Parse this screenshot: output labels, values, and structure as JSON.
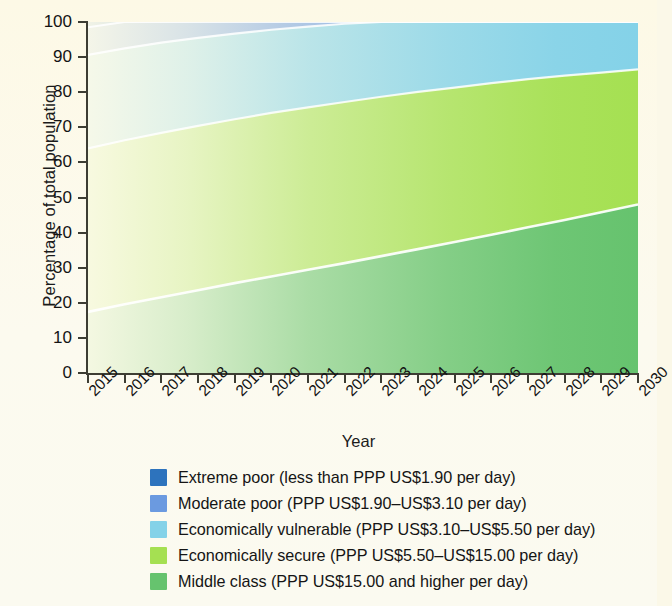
{
  "chart_data": {
    "type": "area",
    "title": "",
    "xlabel": "Year",
    "ylabel": "Percentage of total population",
    "stacked": true,
    "normalized": true,
    "grid": false,
    "legend_position": "bottom",
    "xlim": [
      2015,
      2030
    ],
    "ylim": [
      0,
      100
    ],
    "yticks": [
      0,
      10,
      20,
      30,
      40,
      50,
      60,
      70,
      80,
      90,
      100
    ],
    "ytick_labels": [
      "0",
      "10",
      "20",
      "30",
      "40",
      "50",
      "60",
      "70",
      "80",
      "90",
      "100"
    ],
    "xticks": [
      2015,
      2016,
      2017,
      2018,
      2019,
      2020,
      2021,
      2022,
      2023,
      2024,
      2025,
      2026,
      2027,
      2028,
      2029,
      2030
    ],
    "categories": [
      "2015",
      "2016",
      "2017",
      "2018",
      "2019",
      "2020",
      "2021",
      "2022",
      "2023",
      "2024",
      "2025",
      "2026",
      "2027",
      "2028",
      "2029",
      "2030"
    ],
    "series": [
      {
        "name": "Middle class (PPP US$15.00 and higher per day)",
        "color": "#66c36e",
        "values": [
          17.4,
          19.6,
          21.6,
          23.6,
          25.6,
          27.5,
          29.4,
          31.3,
          33.3,
          35.3,
          37.3,
          39.4,
          41.5,
          43.6,
          45.8,
          48.0
        ]
      },
      {
        "name": "Economically secure (PPP US$5.50–US$15.00 per day)",
        "color": "#a5e052",
        "values": [
          46.6,
          46.7,
          46.8,
          46.8,
          46.7,
          46.6,
          46.3,
          45.9,
          45.4,
          44.8,
          44.0,
          43.2,
          42.2,
          41.1,
          39.8,
          38.5
        ]
      },
      {
        "name": "Economically vulnerable (PPP US$3.10–US$5.50 per day)",
        "color": "#84d2e8",
        "values": [
          26.6,
          26.2,
          25.7,
          25.1,
          24.4,
          23.7,
          23.0,
          22.3,
          21.5,
          20.7,
          19.9,
          19.1,
          18.3,
          17.4,
          16.6,
          15.8
        ]
      },
      {
        "name": "Moderate poor (PPP US$1.90–US$3.10 per day)",
        "color": "#6b9ae0",
        "values": [
          7.9,
          7.6,
          7.2,
          6.9,
          6.6,
          6.2,
          5.9,
          5.6,
          5.3,
          5.0,
          4.7,
          4.4,
          4.1,
          3.8,
          3.5,
          3.3
        ]
      },
      {
        "name": "Extreme poor (less than PPP US$1.90 per day)",
        "color": "#2d73bd",
        "values": [
          1.5,
          1.4,
          1.4,
          1.3,
          1.3,
          1.3,
          1.2,
          1.2,
          1.2,
          1.2,
          1.3,
          1.3,
          1.4,
          1.4,
          1.4,
          1.4
        ]
      }
    ],
    "cumulative_top_boundaries": {
      "note": "cumulative percentage at top of each band, bottom-to-top order",
      "middle_class_top": [
        17.4,
        19.6,
        21.6,
        23.6,
        25.6,
        27.5,
        29.4,
        31.3,
        33.3,
        35.3,
        37.3,
        39.4,
        41.5,
        43.6,
        45.8,
        48.0
      ],
      "economically_secure_top": [
        64.0,
        66.3,
        68.4,
        70.4,
        72.3,
        74.1,
        75.7,
        77.2,
        78.7,
        80.1,
        81.3,
        82.6,
        83.7,
        84.7,
        85.6,
        86.5
      ],
      "economically_vulnerable_top": [
        90.6,
        92.5,
        94.1,
        95.5,
        96.7,
        97.8,
        98.7,
        99.5,
        100.2,
        100.8,
        101.2,
        101.7,
        102.0,
        102.1,
        102.2,
        102.3
      ],
      "moderate_poor_top": [
        98.5,
        98.6,
        98.6,
        98.7,
        98.7,
        98.7,
        98.8,
        98.8,
        98.8,
        98.8,
        98.7,
        98.7,
        98.6,
        98.6,
        98.6,
        98.6
      ],
      "extreme_poor_top": [
        100,
        100,
        100,
        100,
        100,
        100,
        100,
        100,
        100,
        100,
        100,
        100,
        100,
        100,
        100,
        100
      ]
    }
  },
  "legend": {
    "items": [
      {
        "label": "Extreme poor (less than PPP US$1.90 per day)",
        "color": "#2d73bd",
        "swatch_name": "legend-swatch-extreme-poor"
      },
      {
        "label": "Moderate poor (PPP US$1.90–US$3.10 per day)",
        "color": "#6b9ae0",
        "swatch_name": "legend-swatch-moderate-poor"
      },
      {
        "label": "Economically vulnerable (PPP US$3.10–US$5.50 per day)",
        "color": "#84d2e8",
        "swatch_name": "legend-swatch-economically-vulnerable"
      },
      {
        "label": "Economically secure (PPP US$5.50–US$15.00 per day)",
        "color": "#a5e052",
        "swatch_name": "legend-swatch-economically-secure"
      },
      {
        "label": "Middle class (PPP US$15.00 and higher per day)",
        "color": "#66c36e",
        "swatch_name": "legend-swatch-middle-class"
      }
    ]
  },
  "axes": {
    "y_title": "Percentage of total population",
    "x_title": "Year"
  },
  "colors": {
    "background": "#fbf8e8",
    "axis": "#3d3d33",
    "text": "#141414",
    "extreme_poor": "#2d73bd",
    "moderate_poor": "#6b9ae0",
    "economically_vulnerable": "#84d2e8",
    "economically_secure": "#a5e052",
    "middle_class": "#66c36e"
  }
}
